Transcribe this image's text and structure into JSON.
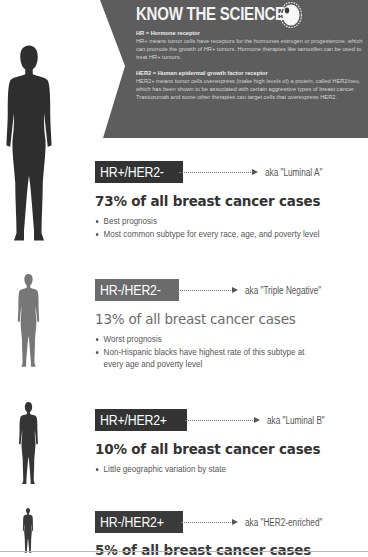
{
  "banner": {
    "title": "KNOW THE SCIENCE",
    "icon": "cell-icon",
    "background_color": "#5d5d5d",
    "hr_term": "HR = Hormone receptor",
    "hr_definition": "HR+ means tumor cells have receptors for the hormones estrogen or progesterone, which can promote the growth of HR+ tumors. Hormone therapies like tamoxifen can be used to treat HR+ tumors.",
    "her2_term": "HER2 = Human epidermal growth factor receptor",
    "her2_definition": "HER2+ means tumor cells overexpress (make high levels of) a protein, called HER2/neu, which has been shown to be associated with certain aggressive types of breast cancer. Trastuzumab and some other therapies can target cells that overexpress HER2."
  },
  "subtypes": [
    {
      "badge": "HR+/HER2-",
      "aka": "aka \"Luminal A\"",
      "headline": "73% of all breast cancer cases",
      "percent": 73,
      "color": "#333333",
      "bullets": [
        "Best prognosis",
        "Most common subtype for every race, age, and poverty level"
      ]
    },
    {
      "badge": "HR-/HER2-",
      "aka": "aka \"Triple Negative\"",
      "headline": "13% of all breast cancer cases",
      "percent": 13,
      "color": "#6b6b6b",
      "bullets": [
        "Worst prognosis",
        "Non-Hispanic blacks have highest rate of this subtype at every age and poverty level"
      ]
    },
    {
      "badge": "HR+/HER2+",
      "aka": "aka \"Luminal B\"",
      "headline": "10% of all breast cancer cases",
      "percent": 10,
      "color": "#333333",
      "bullets": [
        "Little geographic variation by state"
      ]
    },
    {
      "badge": "HR-/HER2+",
      "aka": "aka \"HER2-enriched\"",
      "headline": "5% of all breast cancer cases",
      "percent": 5,
      "color": "#3a3a3a",
      "bullets": []
    }
  ]
}
